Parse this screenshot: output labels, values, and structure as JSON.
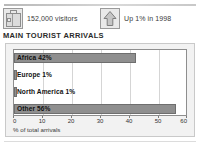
{
  "header": {
    "stats": [
      {
        "icon": "suitcase-icon",
        "text": "152,000 visitors"
      },
      {
        "icon": "up-arrow-icon",
        "text": "Up 1% in 1998"
      }
    ]
  },
  "section": {
    "title": "MAIN TOURIST ARRIVALS"
  },
  "colors": {
    "bar": "#8f8f8f",
    "bar_border": "#6e6e6e",
    "plot_background": "#ffffff",
    "panel_background": "#f2f2f2",
    "panel_border": "#c9c9c9",
    "gridline": "#d5d5d5",
    "axis": "#8e8e8e",
    "label_text": "#111111"
  },
  "chart_data": {
    "type": "bar",
    "orientation": "horizontal",
    "title": "MAIN TOURIST ARRIVALS",
    "xlabel": "% of total arrivals",
    "ylabel": "",
    "xlim": [
      0,
      60
    ],
    "xticks": [
      0,
      10,
      20,
      30,
      40,
      50,
      60
    ],
    "xtick_labels": [
      "0",
      "10",
      "20",
      "30",
      "40",
      "50",
      "60"
    ],
    "grid": true,
    "grid_axis": "x",
    "legend": false,
    "categories": [
      "Africa",
      "Europe",
      "North America",
      "Other"
    ],
    "values": [
      42,
      1,
      1,
      56
    ],
    "bar_labels": [
      "Africa 42%",
      "Europe 1%",
      "North America 1%",
      "Other 56%"
    ],
    "units": "percent"
  }
}
